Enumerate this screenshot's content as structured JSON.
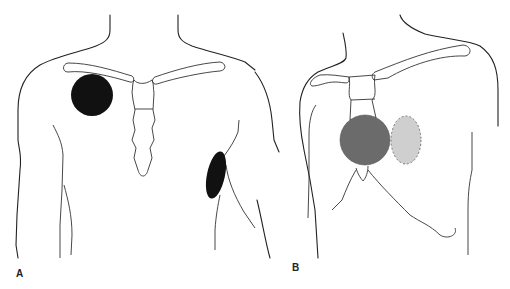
{
  "figure": {
    "panels": [
      {
        "id": "A",
        "label": "A",
        "view": "anterior chest",
        "markers": [
          {
            "name": "right-pectoral-marker",
            "shape": "circle",
            "color": "#111111"
          },
          {
            "name": "left-axillary-marker",
            "shape": "ellipse",
            "color": "#111111"
          }
        ]
      },
      {
        "id": "B",
        "label": "B",
        "view": "oblique chest",
        "markers": [
          {
            "name": "sternal-marker",
            "shape": "circle",
            "color": "#6b6b6b"
          },
          {
            "name": "parasternal-marker",
            "shape": "ellipse",
            "color": "#cfcfcf",
            "outline": "dashed"
          }
        ]
      }
    ]
  }
}
